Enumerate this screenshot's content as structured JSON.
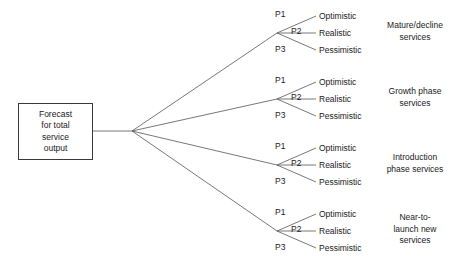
{
  "diagram": {
    "type": "tree",
    "title_visible": false,
    "root": {
      "label": "Forecast\nfor total\nservice\noutput"
    },
    "probability_labels": [
      "P1",
      "P2",
      "P3"
    ],
    "scenario_labels": [
      "Optimistic",
      "Realistic",
      "Pessimistic"
    ],
    "branches": [
      {
        "group_label": "Mature/decline\nservices",
        "probabilities": [
          "P1",
          "P2",
          "P3"
        ],
        "scenarios": [
          "Optimistic",
          "Realistic",
          "Pessimistic"
        ]
      },
      {
        "group_label": "Growth phase\nservices",
        "probabilities": [
          "P1",
          "P2",
          "P3"
        ],
        "scenarios": [
          "Optimistic",
          "Realistic",
          "Pessimistic"
        ]
      },
      {
        "group_label": "Introduction\nphase services",
        "probabilities": [
          "P1",
          "P2",
          "P3"
        ],
        "scenarios": [
          "Optimistic",
          "Realistic",
          "Pessimistic"
        ]
      },
      {
        "group_label": "Near-to-\nlaunch new\nservices",
        "probabilities": [
          "P1",
          "P2",
          "P3"
        ],
        "scenarios": [
          "Optimistic",
          "Realistic",
          "Pessimistic"
        ]
      }
    ],
    "colors": {
      "line": "#555555",
      "box_border": "#3a3a3a",
      "text": "#1a1a1a",
      "background": "#ffffff"
    }
  }
}
